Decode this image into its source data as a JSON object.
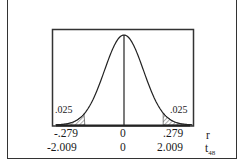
{
  "chart_data": {
    "type": "area",
    "title": "",
    "distribution": "t",
    "df": 48,
    "tails": [
      {
        "side": "left",
        "area_label": ".025"
      },
      {
        "side": "right",
        "area_label": ".025"
      }
    ],
    "axes": [
      {
        "name": "r",
        "ticks": [
          "-.279",
          "0",
          ".279"
        ]
      },
      {
        "name": "t_48",
        "ticks": [
          "-2.009",
          "0",
          "2.009"
        ]
      }
    ],
    "critical_values": {
      "r": [
        -0.279,
        0.279
      ],
      "t": [
        -2.009,
        2.009
      ]
    },
    "grid": false
  },
  "labels": {
    "left_tail": ".025",
    "right_tail": ".025",
    "r_left": "-.279",
    "r_mid": "0",
    "r_right": ".279",
    "r_axis": "r",
    "t_left": "-2.009",
    "t_mid": "0",
    "t_right": "2.009",
    "t_axis": "t",
    "t_sub": "48"
  }
}
